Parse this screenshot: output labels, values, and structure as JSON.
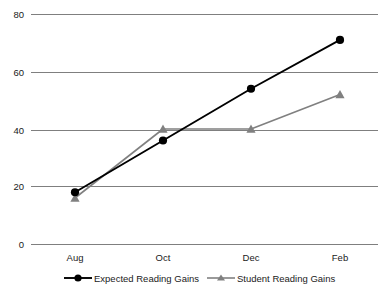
{
  "chart_data": {
    "type": "line",
    "title": "",
    "xlabel": "",
    "ylabel": "",
    "categories": [
      "Aug",
      "Oct",
      "Dec",
      "Feb"
    ],
    "x_tick_labels": [
      "Aug",
      "Oct",
      "Dec",
      "Feb"
    ],
    "y_tick_labels": [
      "0",
      "20",
      "40",
      "60",
      "80"
    ],
    "ylim": [
      0,
      80
    ],
    "y_ticks": [
      0,
      20,
      40,
      60,
      80
    ],
    "grid": "horizontal",
    "legend_position": "bottom",
    "series": [
      {
        "name": "Expected Reading Gains",
        "values": [
          18,
          36,
          54,
          71
        ],
        "color": "#000000",
        "marker": "circle"
      },
      {
        "name": "Student Reading Gains",
        "values": [
          16,
          40,
          40,
          52
        ],
        "color": "#808080",
        "marker": "triangle"
      }
    ]
  },
  "axis": {
    "y_labels": [
      {
        "text": "80",
        "value": 80
      },
      {
        "text": "60",
        "value": 60
      },
      {
        "text": "40",
        "value": 40
      },
      {
        "text": "20",
        "value": 20
      },
      {
        "text": "0",
        "value": 0
      }
    ],
    "x_labels": [
      {
        "text": "Aug"
      },
      {
        "text": "Oct"
      },
      {
        "text": "Dec"
      },
      {
        "text": "Feb"
      }
    ]
  },
  "legend": {
    "items": [
      {
        "label": "Expected Reading Gains",
        "color": "#000000",
        "marker": "circle-marker-icon"
      },
      {
        "label": "Student Reading Gains",
        "color": "#808080",
        "marker": "triangle-marker-icon"
      }
    ]
  },
  "colors": {
    "expected_series": "#000000",
    "student_series": "#808080",
    "gridline": "#7f7f7f",
    "background": "#ffffff",
    "text": "#1a1a1a"
  }
}
